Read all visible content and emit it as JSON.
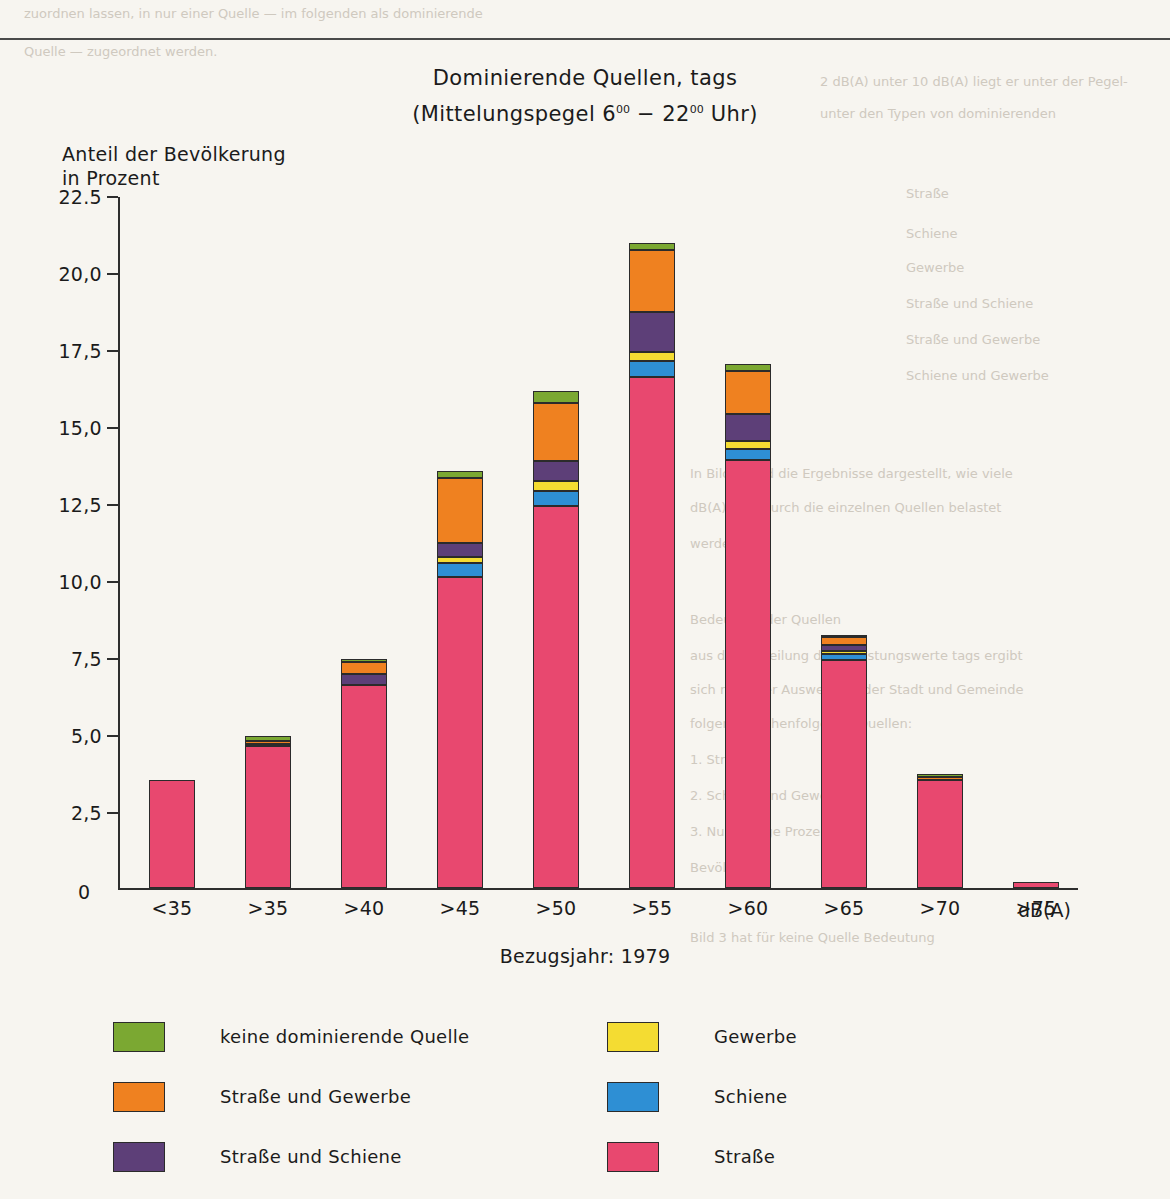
{
  "page": {
    "background": "#f7f5f0",
    "top_rule_y": 38,
    "bleed_texts": [
      {
        "text": "zuordnen lassen, in nur einer Quelle — im folgenden als dominierende",
        "x": 24,
        "y": 6
      },
      {
        "text": "Quelle — zugeordnet werden.",
        "x": 24,
        "y": 44
      },
      {
        "text": "2 dB(A) unter 10 dB(A) liegt er unter der Pegel-",
        "x": 820,
        "y": 74
      },
      {
        "text": "unter den Typen von dominierenden",
        "x": 820,
        "y": 106
      },
      {
        "text": "Straße",
        "x": 906,
        "y": 186
      },
      {
        "text": "Schiene",
        "x": 906,
        "y": 226
      },
      {
        "text": "Gewerbe",
        "x": 906,
        "y": 260
      },
      {
        "text": "Straße und Schiene",
        "x": 906,
        "y": 296
      },
      {
        "text": "Straße und Gewerbe",
        "x": 906,
        "y": 332
      },
      {
        "text": "Schiene und Gewerbe",
        "x": 906,
        "y": 368
      },
      {
        "text": "In Bild 3 sind die Ergebnisse dargestellt, wie viele",
        "x": 690,
        "y": 466
      },
      {
        "text": "dB(A) tags durch die einzelnen Quellen belastet",
        "x": 690,
        "y": 500
      },
      {
        "text": "werden.",
        "x": 690,
        "y": 536
      },
      {
        "text": "Bedeutung der Quellen",
        "x": 690,
        "y": 612
      },
      {
        "text": "aus der Verteilung der Belastungswerte tags ergibt",
        "x": 690,
        "y": 648
      },
      {
        "text": "sich nach der Auswertung der Stadt und Gemeinde",
        "x": 690,
        "y": 682
      },
      {
        "text": "folgende Reihenfolge der Quellen:",
        "x": 690,
        "y": 716
      },
      {
        "text": "1. Straße",
        "x": 690,
        "y": 752
      },
      {
        "text": "2. Schiene und Gewerbe",
        "x": 690,
        "y": 788
      },
      {
        "text": "3. Nur wenige Prozent der",
        "x": 690,
        "y": 824
      },
      {
        "text": "Bevölkerung",
        "x": 690,
        "y": 860
      },
      {
        "text": "Bild 3 hat für keine Quelle Bedeutung",
        "x": 690,
        "y": 930
      }
    ]
  },
  "chart_data": {
    "type": "bar",
    "stacked": true,
    "title": "Dominierende Quellen, tags",
    "subtitle_prefix": "(Mittelungspegel 6",
    "subtitle_mid": " − 22",
    "subtitle_suffix": " Uhr)",
    "subtitle_sup": "00",
    "ylabel": "Anteil der Bevölkerung\nin Prozent",
    "xlabel": "",
    "xunit": "dB(A)",
    "footnote": "Bezugsjahr: 1979",
    "ylim": [
      0,
      22.5
    ],
    "grid": false,
    "legend_position": "bottom",
    "ytick_labels": [
      "22.5",
      "20,0",
      "17,5",
      "15,0",
      "12,5",
      "10,0",
      "7,5",
      "5,0",
      "2,5",
      "0"
    ],
    "ytick_values": [
      22.5,
      20.0,
      17.5,
      15.0,
      12.5,
      10.0,
      7.5,
      5.0,
      2.5,
      0
    ],
    "categories": [
      "<35",
      ">35",
      ">40",
      ">45",
      ">50",
      ">55",
      ">60",
      ">65",
      ">70",
      ">75"
    ],
    "series": [
      {
        "name": "Straße",
        "color": "#e8486f",
        "values": [
          3.5,
          4.6,
          6.6,
          10.1,
          12.4,
          16.6,
          13.9,
          7.4,
          3.5,
          0.2
        ]
      },
      {
        "name": "Schiene",
        "color": "#2e8fd4",
        "values": [
          0.0,
          0.0,
          0.0,
          0.45,
          0.5,
          0.5,
          0.35,
          0.2,
          0.0,
          0.0
        ]
      },
      {
        "name": "Gewerbe",
        "color": "#f4dc32",
        "values": [
          0.0,
          0.0,
          0.0,
          0.2,
          0.3,
          0.3,
          0.25,
          0.1,
          0.0,
          0.0
        ]
      },
      {
        "name": "Straße und Schiene",
        "color": "#5d3f78",
        "values": [
          0.0,
          0.05,
          0.35,
          0.45,
          0.65,
          1.3,
          0.9,
          0.2,
          0.0,
          0.0
        ]
      },
      {
        "name": "Straße und Gewerbe",
        "color": "#ef8120",
        "values": [
          0.0,
          0.1,
          0.4,
          2.1,
          1.9,
          2.0,
          1.4,
          0.25,
          0.1,
          0.0
        ]
      },
      {
        "name": "keine dominierende Quelle",
        "color": "#7ba832",
        "values": [
          0.0,
          0.15,
          0.05,
          0.25,
          0.4,
          0.25,
          0.2,
          0.05,
          0.1,
          0.0
        ]
      }
    ],
    "totals": [
      3.5,
      4.9,
      7.4,
      13.55,
      16.15,
      20.95,
      17.0,
      8.2,
      3.7,
      0.2
    ]
  },
  "legend": {
    "left_column": [
      {
        "label": "keine dominierende Quelle",
        "color": "#7ba832"
      },
      {
        "label": "Straße und Gewerbe",
        "color": "#ef8120"
      },
      {
        "label": "Straße und Schiene",
        "color": "#5d3f78"
      }
    ],
    "right_column": [
      {
        "label": "Gewerbe",
        "color": "#f4dc32"
      },
      {
        "label": "Schiene",
        "color": "#2e8fd4"
      },
      {
        "label": "Straße",
        "color": "#e8486f"
      }
    ]
  }
}
